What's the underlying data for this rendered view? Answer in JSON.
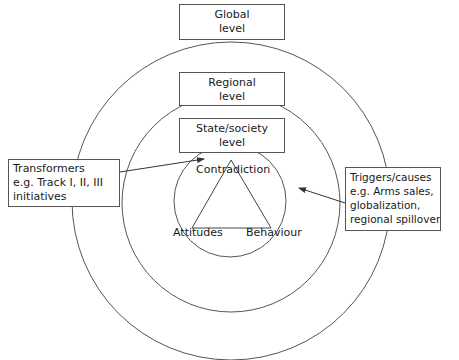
{
  "levels": {
    "global": {
      "line1": "Global",
      "line2": "level"
    },
    "regional": {
      "line1": "Regional",
      "line2": "level"
    },
    "state": {
      "line1": "State/society",
      "line2": "level"
    }
  },
  "triangle": {
    "top": "Contradiction",
    "left": "Attitudes",
    "right": "Behaviour"
  },
  "transformers": {
    "line1": "Transformers",
    "line2": "e.g. Track I, II, III",
    "line3": "initiatives"
  },
  "triggers": {
    "line1": "Triggers/causes",
    "line2": "e.g. Arms sales,",
    "line3": "globalization,",
    "line4": "regional spillover"
  },
  "colors": {
    "stroke": "#555555",
    "text": "#1a1a1a",
    "background": "#ffffff"
  }
}
